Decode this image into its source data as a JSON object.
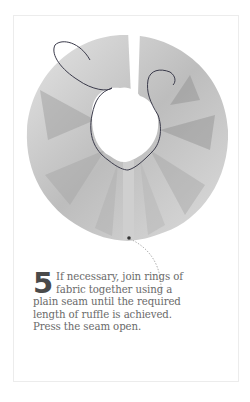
{
  "step": {
    "number": "5",
    "text": "If necessary, join rings of fabric together using a plain seam until the required length of ruffle is achieved. Press the seam open."
  },
  "illustration": {
    "subject": "fabric ruffle ring with gathering thread and seam",
    "fabric_color": "#c8c8c8",
    "thread_color": "#3a3a4a",
    "leader_color": "#9a9a9a"
  }
}
